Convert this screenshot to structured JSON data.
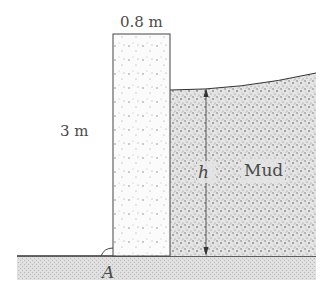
{
  "diagram": {
    "labels": {
      "wall_width": "0.8 m",
      "wall_height": "3 m",
      "mud_depth": "h",
      "mud": "Mud",
      "pivot_point": "A"
    },
    "colors": {
      "outline": "#333333",
      "ground_fill": "#d9d9d9",
      "wall_fill": "#f7f7f7",
      "mud_fill": "#c8c8c8",
      "text": "#4a4a4a"
    }
  }
}
